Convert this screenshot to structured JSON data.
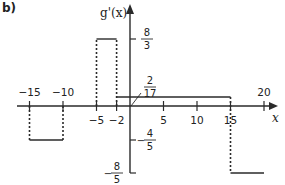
{
  "panel_label": "b)",
  "chart_data": {
    "type": "line",
    "title": "",
    "xlabel": "x",
    "ylabel": "g'(x)",
    "xlim": [
      -17,
      22
    ],
    "ylim": [
      -1.8,
      3.3
    ],
    "grid": false,
    "legend": null,
    "x_ticks": [
      -15,
      -10,
      -5,
      -2,
      5,
      10,
      15,
      20
    ],
    "x_tick_labels": [
      "−15",
      "−10",
      "−5",
      "−2",
      "5",
      "10",
      "15",
      "20"
    ],
    "y_ticks": [
      {
        "value": 2.6667,
        "num": "8",
        "den": "3",
        "sign": ""
      },
      {
        "value": 0.1176,
        "num": "2",
        "den": "17",
        "sign": ""
      },
      {
        "value": -0.8,
        "num": "4",
        "den": "5",
        "sign": "−"
      },
      {
        "value": -1.6,
        "num": "8",
        "den": "5",
        "sign": "−"
      }
    ],
    "segments": [
      {
        "x_start": -15,
        "x_end": -10,
        "y": -0.8,
        "label": "−4/5"
      },
      {
        "x_start": -5,
        "x_end": -2,
        "y": 2.6667,
        "label": "8/3"
      },
      {
        "x_start": -2,
        "x_end": 15,
        "y": 0.1176,
        "label": "2/17"
      },
      {
        "x_start": 15,
        "x_end": 20,
        "y": -1.6,
        "label": "−8/5"
      }
    ],
    "dotted_verticals": [
      {
        "x": -15,
        "y_from": 0,
        "y_to": -0.8
      },
      {
        "x": -10,
        "y_from": 0,
        "y_to": -0.8
      },
      {
        "x": -5,
        "y_from": 0,
        "y_to": 2.6667
      },
      {
        "x": -2,
        "y_from": 0,
        "y_to": 2.6667
      },
      {
        "x": 15,
        "y_from": 0.1176,
        "y_to": -1.6
      }
    ]
  }
}
